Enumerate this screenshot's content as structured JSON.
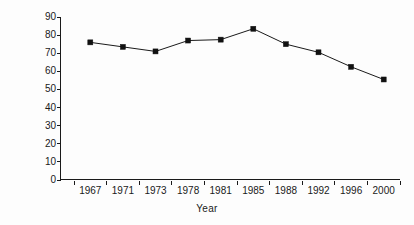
{
  "chart_data": {
    "type": "line",
    "title": "",
    "xlabel": "Year",
    "ylabel": "Voting turnout",
    "categories": [
      "1967",
      "1971",
      "1973",
      "1978",
      "1981",
      "1985",
      "1988",
      "1992",
      "1996",
      "2000"
    ],
    "values": [
      76,
      73.5,
      71,
      77,
      77.5,
      83.5,
      75,
      70.5,
      62.5,
      55.5
    ],
    "series": [
      {
        "name": "Voting turnout",
        "values": [
          76,
          73.5,
          71,
          77,
          77.5,
          83.5,
          75,
          70.5,
          62.5,
          55.5
        ]
      }
    ],
    "ylim": [
      0,
      90
    ],
    "yticks": [
      0,
      10,
      20,
      30,
      40,
      50,
      60,
      70,
      80,
      90
    ],
    "ytick_labels": [
      "0",
      "10",
      "20",
      "30",
      "40",
      "50",
      "60",
      "70",
      "80",
      "90"
    ],
    "grid": false,
    "legend": null,
    "marker": "square",
    "line_color": "#1a1a1a",
    "marker_color": "#111111",
    "background_color": "#fdfdfd"
  }
}
